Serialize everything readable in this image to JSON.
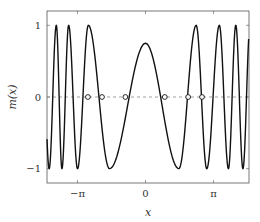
{
  "chart_data": {
    "type": "line",
    "title": "",
    "xlabel": "x",
    "ylabel": "m(x)",
    "xlim": [
      -4.55,
      4.78
    ],
    "ylim": [
      -1.2,
      1.2
    ],
    "grid": false,
    "legend": null,
    "x_ticks": [
      {
        "value": -3.14159,
        "label": "−π"
      },
      {
        "value": 0,
        "label": "0"
      },
      {
        "value": 3.14159,
        "label": "π"
      }
    ],
    "y_ticks": [
      {
        "value": -1,
        "label": "−1"
      },
      {
        "value": 0,
        "label": "0"
      },
      {
        "value": 1,
        "label": "1"
      }
    ],
    "reference_line": {
      "y": 0,
      "style": "dashed",
      "color": "#888888"
    },
    "series": [
      {
        "name": "m(x)",
        "color": "#111111",
        "style": "solid",
        "description": "Symmetric oscillation; broad central peak ≈0.75 at x=0, increasingly rapid oscillations between −1 and 1 for |x| larger",
        "extrema": [
          {
            "x": -4.45,
            "y": -1
          },
          {
            "x": -4.12,
            "y": 1
          },
          {
            "x": -3.86,
            "y": -1
          },
          {
            "x": -3.55,
            "y": 1
          },
          {
            "x": -3.14,
            "y": -1
          },
          {
            "x": -2.64,
            "y": 1
          },
          {
            "x": -1.66,
            "y": -1
          },
          {
            "x": 0.0,
            "y": 0.75
          },
          {
            "x": 1.54,
            "y": -1
          },
          {
            "x": 2.34,
            "y": 1
          },
          {
            "x": 2.83,
            "y": -1
          },
          {
            "x": 3.41,
            "y": 1
          },
          {
            "x": 3.83,
            "y": -1
          },
          {
            "x": 4.17,
            "y": 1
          },
          {
            "x": 4.5,
            "y": -1
          }
        ]
      }
    ],
    "markers": {
      "shape": "circle-open",
      "y": 0,
      "x": [
        -2.66,
        -2.01,
        -0.93,
        0.89,
        1.97,
        2.61
      ]
    }
  }
}
